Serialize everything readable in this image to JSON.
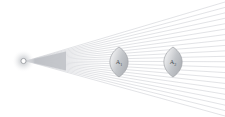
{
  "figure": {
    "background_color": "#ffffff",
    "width": 225,
    "height": 117
  },
  "source": {
    "name": "point-light-source",
    "label": "",
    "cx": 23.5,
    "cy": 61.0,
    "disc_radius": 2.6,
    "halo_radius": 11.5,
    "disc_color": "#ffffff",
    "outline_color": "#9a9da2",
    "halo_color": "#d8dadd"
  },
  "ray_fan": {
    "name": "ray-bundle",
    "origin_x": 26.0,
    "origin_y": 61.0,
    "ray_count": 22,
    "stroke_color": "#c9ccd1",
    "stroke_width": 0.55,
    "end_x": 225,
    "angle_top_end_y": 2,
    "angle_bottom_end_y": 116,
    "core_color": "#b9bcc1",
    "core_end_x": 66,
    "core_spread": 9.5
  },
  "apertures": [
    {
      "name": "aperture-a1",
      "label": "A",
      "subscript": "1",
      "cx": 119.0,
      "cy": 62.0,
      "rx": 9.0,
      "ry": 15.0,
      "fill_light": "#f2f3f4",
      "fill_dark": "#b9bcc1",
      "outline_color": "#a0a3a8"
    },
    {
      "name": "aperture-a2",
      "label": "A",
      "subscript": "2",
      "cx": 173.0,
      "cy": 62.0,
      "rx": 9.0,
      "ry": 15.0,
      "fill_light": "#f2f3f4",
      "fill_dark": "#b9bcc1",
      "outline_color": "#a0a3a8"
    }
  ]
}
